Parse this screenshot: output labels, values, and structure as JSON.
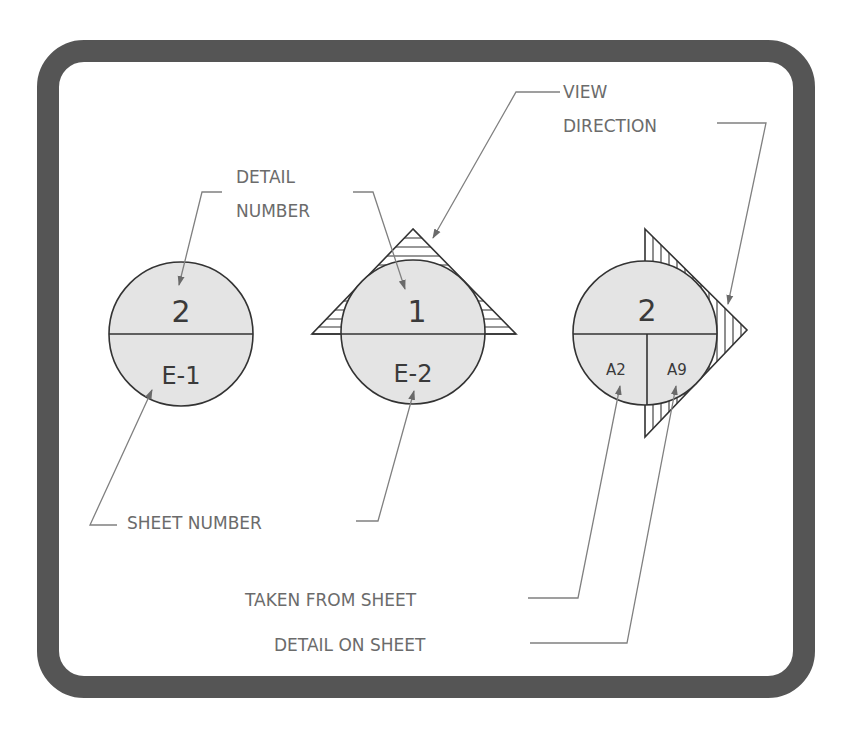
{
  "diagram": {
    "frame": {
      "border_color": "#555555",
      "background": "#ffffff"
    },
    "labels": {
      "detail_number": [
        "DETAIL",
        "NUMBER"
      ],
      "view_direction": [
        "VIEW",
        "DIRECTION"
      ],
      "sheet_number": "SHEET NUMBER",
      "taken_from_sheet": "TAKEN FROM SHEET",
      "detail_on_sheet": "DETAIL ON SHEET"
    },
    "symbols": [
      {
        "id": "detail-callout",
        "top": "2",
        "bottom": "E-1",
        "type": "circle-split"
      },
      {
        "id": "section-callout-up",
        "top": "1",
        "bottom": "E-2",
        "type": "circle-with-up-triangle",
        "hatch": "horizontal"
      },
      {
        "id": "section-callout-right",
        "top": "2",
        "bottom_left": "A2",
        "bottom_right": "A9",
        "type": "circle-with-right-triangle",
        "hatch": "vertical"
      }
    ],
    "colors": {
      "circle_fill": "#e4e4e4",
      "line": "#333333",
      "leader": "#808080",
      "label_text": "#6b6b6b"
    }
  }
}
